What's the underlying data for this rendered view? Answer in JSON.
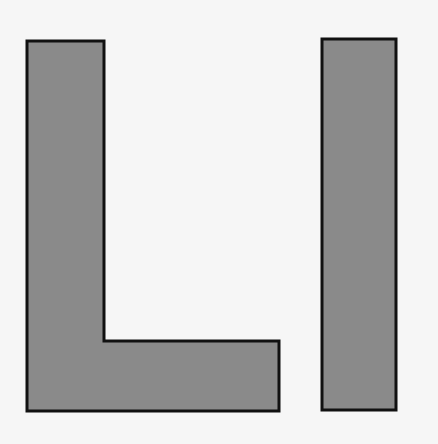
{
  "canvas": {
    "width": 438,
    "height": 444,
    "background": "#f6f6f6"
  },
  "shapes": [
    {
      "name": "letter-L",
      "fill": "#8a8a8a",
      "stroke": "#111111",
      "points": "27,41 104,41 104,341 279,341 279,411 27,411"
    },
    {
      "name": "letter-I",
      "fill": "#8a8a8a",
      "stroke": "#111111",
      "points": "322,39 396,39 396,410 322,410"
    }
  ]
}
